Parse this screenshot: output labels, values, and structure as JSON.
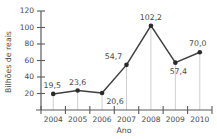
{
  "chart_data": {
    "type": "line",
    "title": "",
    "xlabel": "Ano",
    "ylabel": "Bilhões de reais",
    "categories": [
      "2004",
      "2005",
      "2006",
      "2007",
      "2008",
      "2009",
      "2010"
    ],
    "values": [
      19.5,
      23.6,
      20.6,
      54.7,
      102.2,
      57.4,
      70.0
    ],
    "point_labels": [
      "19,5",
      "23,6",
      "20,6",
      "54,7",
      "102,2",
      "57,4",
      "70,0"
    ],
    "label_positions": [
      "above",
      "above",
      "below",
      "above",
      "above",
      "below",
      "above"
    ],
    "yticks": [
      20,
      40,
      60,
      80,
      100,
      120
    ],
    "ytick_labels": [
      "20",
      "40",
      "60",
      "80",
      "100",
      "120"
    ],
    "ylim": [
      0,
      120
    ],
    "grid": false,
    "droplines": true,
    "legend": "none",
    "marker": "filled-circle",
    "colors": {
      "line": "#3f3f3f",
      "marker": "#2b2b2b",
      "axis": "#5b5b5b",
      "dropline": "#c9c9c9",
      "text": "#4a4a4a",
      "background": "#ffffff"
    }
  }
}
